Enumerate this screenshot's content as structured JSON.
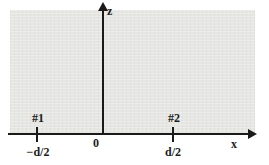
{
  "diagram": {
    "axes": {
      "vertical_label": "z",
      "horizontal_label": "x",
      "origin_label": "0"
    },
    "points": [
      {
        "id": "#1",
        "coordinate": "−d/2"
      },
      {
        "id": "#2",
        "coordinate": "d/2"
      }
    ],
    "colors": {
      "background": "#ffffff",
      "region_fill": "#e6e6e3",
      "line": "#1a1a1a",
      "text": "#1c1c1c"
    }
  }
}
